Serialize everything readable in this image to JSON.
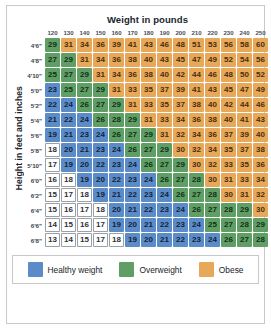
{
  "title": "Weight in pounds",
  "axis_label_y": "Height in feet and inches",
  "legend": [
    {
      "key": "healthy",
      "label": "Healthy weight",
      "color": "#5b8cc8"
    },
    {
      "key": "over",
      "label": "Overweight",
      "color": "#5f9e64"
    },
    {
      "key": "obese",
      "label": "Obese",
      "color": "#e8a85a"
    }
  ],
  "colors": {
    "underweight": "#ffffff",
    "healthy": "#5b8cc8",
    "overweight": "#5f9e64",
    "obese": "#e8a85a",
    "frame_border": "#c9c9c9",
    "text_dark": "#20252b"
  },
  "chart_data": {
    "type": "heatmap",
    "title": "Weight in pounds",
    "xlabel": "Weight in pounds",
    "ylabel": "Height in feet and inches",
    "grid": false,
    "legend_position": "bottom",
    "categories": [
      "120",
      "130",
      "140",
      "150",
      "160",
      "170",
      "180",
      "190",
      "200",
      "210",
      "220",
      "230",
      "240",
      "250"
    ],
    "rows": [
      "4'6\"",
      "4'8\"",
      "4'10\"",
      "5'0\"",
      "5'2\"",
      "5'4\"",
      "5'6\"",
      "5'8\"",
      "5'10\"",
      "6'0\"",
      "6'2\"",
      "6'4\"",
      "6'6\"",
      "6'8\""
    ],
    "values": [
      [
        29,
        31,
        34,
        36,
        39,
        41,
        43,
        46,
        48,
        51,
        53,
        56,
        58,
        60
      ],
      [
        27,
        29,
        31,
        34,
        36,
        38,
        40,
        43,
        45,
        47,
        49,
        52,
        54,
        56
      ],
      [
        25,
        27,
        29,
        31,
        34,
        36,
        38,
        40,
        42,
        44,
        46,
        48,
        50,
        52
      ],
      [
        23,
        25,
        27,
        29,
        31,
        33,
        35,
        37,
        39,
        41,
        43,
        45,
        47,
        49
      ],
      [
        22,
        24,
        26,
        27,
        29,
        31,
        33,
        35,
        37,
        38,
        40,
        42,
        44,
        46
      ],
      [
        21,
        22,
        24,
        26,
        28,
        29,
        31,
        33,
        34,
        36,
        38,
        40,
        41,
        43
      ],
      [
        19,
        21,
        23,
        24,
        26,
        27,
        29,
        31,
        32,
        34,
        36,
        37,
        39,
        40
      ],
      [
        18,
        20,
        21,
        23,
        24,
        26,
        27,
        29,
        30,
        32,
        34,
        35,
        37,
        38
      ],
      [
        17,
        19,
        20,
        22,
        23,
        24,
        26,
        27,
        29,
        30,
        32,
        33,
        35,
        36
      ],
      [
        16,
        18,
        19,
        20,
        22,
        23,
        24,
        26,
        27,
        28,
        30,
        31,
        33,
        34
      ],
      [
        15,
        17,
        18,
        19,
        21,
        22,
        23,
        24,
        26,
        27,
        28,
        30,
        31,
        32
      ],
      [
        15,
        16,
        17,
        18,
        20,
        21,
        22,
        23,
        24,
        26,
        27,
        28,
        29,
        30
      ],
      [
        14,
        15,
        16,
        17,
        19,
        20,
        21,
        22,
        23,
        24,
        25,
        27,
        28,
        29
      ],
      [
        13,
        14,
        15,
        17,
        18,
        19,
        20,
        21,
        22,
        23,
        24,
        26,
        27,
        28
      ]
    ],
    "categories_map": [
      [
        "over",
        "obese",
        "obese",
        "obese",
        "obese",
        "obese",
        "obese",
        "obese",
        "obese",
        "obese",
        "obese",
        "obese",
        "obese",
        "obese"
      ],
      [
        "over",
        "over",
        "obese",
        "obese",
        "obese",
        "obese",
        "obese",
        "obese",
        "obese",
        "obese",
        "obese",
        "obese",
        "obese",
        "obese"
      ],
      [
        "over",
        "over",
        "over",
        "obese",
        "obese",
        "obese",
        "obese",
        "obese",
        "obese",
        "obese",
        "obese",
        "obese",
        "obese",
        "obese"
      ],
      [
        "healthy",
        "over",
        "over",
        "over",
        "obese",
        "obese",
        "obese",
        "obese",
        "obese",
        "obese",
        "obese",
        "obese",
        "obese",
        "obese"
      ],
      [
        "healthy",
        "healthy",
        "over",
        "over",
        "over",
        "obese",
        "obese",
        "obese",
        "obese",
        "obese",
        "obese",
        "obese",
        "obese",
        "obese"
      ],
      [
        "healthy",
        "healthy",
        "healthy",
        "over",
        "over",
        "over",
        "obese",
        "obese",
        "obese",
        "obese",
        "obese",
        "obese",
        "obese",
        "obese"
      ],
      [
        "healthy",
        "healthy",
        "healthy",
        "healthy",
        "over",
        "over",
        "over",
        "obese",
        "obese",
        "obese",
        "obese",
        "obese",
        "obese",
        "obese"
      ],
      [
        "under",
        "healthy",
        "healthy",
        "healthy",
        "healthy",
        "over",
        "over",
        "over",
        "obese",
        "obese",
        "obese",
        "obese",
        "obese",
        "obese"
      ],
      [
        "under",
        "healthy",
        "healthy",
        "healthy",
        "healthy",
        "healthy",
        "over",
        "over",
        "over",
        "obese",
        "obese",
        "obese",
        "obese",
        "obese"
      ],
      [
        "under",
        "under",
        "healthy",
        "healthy",
        "healthy",
        "healthy",
        "healthy",
        "over",
        "over",
        "over",
        "obese",
        "obese",
        "obese",
        "obese"
      ],
      [
        "under",
        "under",
        "under",
        "healthy",
        "healthy",
        "healthy",
        "healthy",
        "healthy",
        "over",
        "over",
        "over",
        "obese",
        "obese",
        "obese"
      ],
      [
        "under",
        "under",
        "under",
        "under",
        "healthy",
        "healthy",
        "healthy",
        "healthy",
        "healthy",
        "over",
        "over",
        "over",
        "over",
        "obese"
      ],
      [
        "under",
        "under",
        "under",
        "under",
        "healthy",
        "healthy",
        "healthy",
        "healthy",
        "healthy",
        "healthy",
        "over",
        "over",
        "over",
        "over"
      ],
      [
        "under",
        "under",
        "under",
        "under",
        "under",
        "healthy",
        "healthy",
        "healthy",
        "healthy",
        "healthy",
        "healthy",
        "over",
        "over",
        "over"
      ]
    ]
  }
}
